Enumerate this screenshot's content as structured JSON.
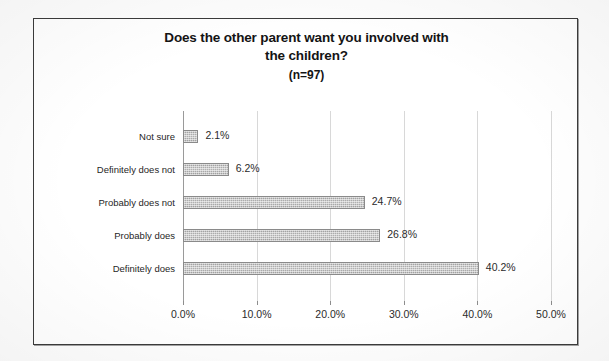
{
  "chart_data": {
    "type": "bar",
    "orientation": "horizontal",
    "title": "Does the other parent want you involved with the children?",
    "title_lines": [
      "Does the other parent want you involved with",
      "the children?"
    ],
    "subtitle": "(n=97)",
    "sample_size": 97,
    "categories": [
      "Definitely does",
      "Probably does",
      "Probably does not",
      "Definitely does not",
      "Not sure"
    ],
    "values": [
      40.2,
      26.8,
      24.7,
      6.2,
      2.1
    ],
    "data_labels": [
      "40.2%",
      "26.8%",
      "24.7%",
      "6.2%",
      "2.1%"
    ],
    "xlabel": "",
    "ylabel": "",
    "xlim": [
      0,
      50
    ],
    "xtick_values": [
      0,
      10,
      20,
      30,
      40,
      50
    ],
    "xtick_labels": [
      "0.0%",
      "10.0%",
      "20.0%",
      "30.0%",
      "40.0%",
      "50.0%"
    ],
    "grid": true,
    "grid_axis": "x",
    "legend": false,
    "bar_color": "#a8a8a8",
    "axis_color": "#9a9a9a",
    "grid_color": "#d8d8d8",
    "text_color": "#262626",
    "background": "#ffffff",
    "border_color": "#3b3b3b"
  }
}
